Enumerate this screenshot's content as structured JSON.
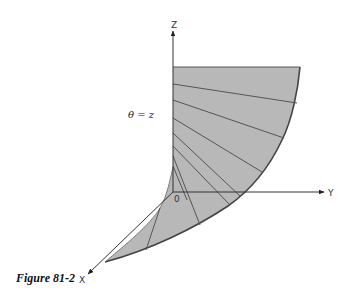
{
  "figure": {
    "caption": "Figure 81-2",
    "annotation": "θ = z",
    "axes": {
      "z_label": "Z",
      "y_label": "Y",
      "x_label": "X",
      "origin_label": "0"
    },
    "colors": {
      "surface_fill": "#b8b8b8",
      "edge": "#444444",
      "ruling": "#555555",
      "axis": "#333333",
      "background": "#ffffff"
    },
    "surface": {
      "description": "Helicoid-like ruled surface bounded by the Z axis and an outer spiral curve, with radial rulings",
      "ruling_count": 9
    }
  }
}
